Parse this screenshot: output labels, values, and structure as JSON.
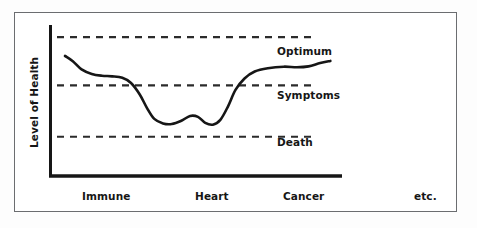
{
  "figure": {
    "background_color": "#ffffff",
    "frame_color": "#6b6d70",
    "ink_color": "#161616"
  },
  "axes": {
    "y_axis_label": "Level of Health",
    "x_axis_label": ""
  },
  "chart_data": {
    "type": "line",
    "title": "",
    "subtitle": "",
    "xlabel": "",
    "ylabel": "Level of Health",
    "grid": false,
    "legend_position": "none",
    "x_tick_labels": [
      "Immune",
      "Heart",
      "Cancer"
    ],
    "x_tick_positions": [
      0.2,
      0.55,
      0.86
    ],
    "xlim": [
      0,
      1
    ],
    "ylim": [
      0,
      1
    ],
    "y_tick_labels": [],
    "threshold_lines": [
      {
        "label": "Optimum",
        "value": 0.92,
        "style": "dashed",
        "color": "#2b2b2b"
      },
      {
        "label": "Symptoms",
        "value": 0.6,
        "style": "dashed",
        "color": "#2b2b2b"
      },
      {
        "label": "Death",
        "value": 0.26,
        "style": "dashed",
        "color": "#2b2b2b"
      }
    ],
    "annotations": [
      {
        "text": "etc.",
        "position": "below-axis-right"
      }
    ],
    "series": [
      {
        "name": "Level of Health",
        "color": "#161616",
        "line_width": 2.6,
        "smooth": true,
        "points": [
          {
            "x": 0.048,
            "y": 0.795
          },
          {
            "x": 0.075,
            "y": 0.76
          },
          {
            "x": 0.105,
            "y": 0.706
          },
          {
            "x": 0.14,
            "y": 0.676
          },
          {
            "x": 0.175,
            "y": 0.664
          },
          {
            "x": 0.21,
            "y": 0.66
          },
          {
            "x": 0.245,
            "y": 0.65
          },
          {
            "x": 0.275,
            "y": 0.616
          },
          {
            "x": 0.305,
            "y": 0.54
          },
          {
            "x": 0.33,
            "y": 0.45
          },
          {
            "x": 0.355,
            "y": 0.378
          },
          {
            "x": 0.385,
            "y": 0.348
          },
          {
            "x": 0.415,
            "y": 0.344
          },
          {
            "x": 0.448,
            "y": 0.366
          },
          {
            "x": 0.478,
            "y": 0.398
          },
          {
            "x": 0.505,
            "y": 0.392
          },
          {
            "x": 0.53,
            "y": 0.352
          },
          {
            "x": 0.556,
            "y": 0.34
          },
          {
            "x": 0.582,
            "y": 0.372
          },
          {
            "x": 0.608,
            "y": 0.46
          },
          {
            "x": 0.634,
            "y": 0.57
          },
          {
            "x": 0.665,
            "y": 0.646
          },
          {
            "x": 0.7,
            "y": 0.692
          },
          {
            "x": 0.745,
            "y": 0.714
          },
          {
            "x": 0.8,
            "y": 0.724
          },
          {
            "x": 0.845,
            "y": 0.72
          },
          {
            "x": 0.885,
            "y": 0.726
          },
          {
            "x": 0.925,
            "y": 0.748
          },
          {
            "x": 0.96,
            "y": 0.762
          }
        ]
      }
    ]
  }
}
